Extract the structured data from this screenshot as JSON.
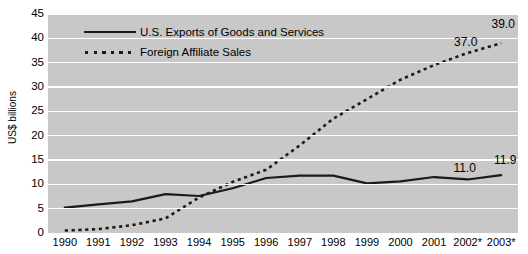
{
  "chart_data": {
    "type": "line",
    "title": "",
    "xlabel": "",
    "ylabel": "US$ billions",
    "ylim": [
      0,
      45
    ],
    "ytick_values": [
      0,
      5,
      10,
      15,
      20,
      25,
      30,
      35,
      40,
      45
    ],
    "ytick_labels": [
      "0",
      "5",
      "10",
      "15",
      "20",
      "25",
      "30",
      "35",
      "40",
      "45"
    ],
    "grid": true,
    "grid_color": "#ffffff",
    "plot_background": "#c8c8c8",
    "legend_position": "top-left inside plot",
    "categories": [
      "1990",
      "1991",
      "1992",
      "1993",
      "1994",
      "1995",
      "1996",
      "1997",
      "1998",
      "1999",
      "2000",
      "2001",
      "2002*",
      "2003*"
    ],
    "x": [
      1990,
      1991,
      1992,
      1993,
      1994,
      1995,
      1996,
      1997,
      1998,
      1999,
      2000,
      2001,
      2002,
      2003
    ],
    "series": [
      {
        "name": "U.S. Exports of Goods and Services",
        "style": "solid",
        "color": "#1a1a1a",
        "values": [
          5.2,
          5.9,
          6.5,
          8.0,
          7.6,
          9.2,
          11.3,
          11.8,
          11.8,
          10.2,
          10.6,
          11.5,
          11.0,
          11.9
        ]
      },
      {
        "name": "Foreign Affiliate Sales",
        "style": "dotted",
        "color": "#1a1a1a",
        "values": [
          0.5,
          0.8,
          1.6,
          3.0,
          7.3,
          10.5,
          13.0,
          18.0,
          23.5,
          27.5,
          31.5,
          34.5,
          37.0,
          39.0
        ]
      }
    ],
    "annotations": [
      {
        "text": "37.0",
        "x": "2002*",
        "value": 37.0,
        "series": "Foreign Affiliate Sales"
      },
      {
        "text": "39.0",
        "x": "2003*",
        "value": 39.0,
        "series": "Foreign Affiliate Sales"
      },
      {
        "text": "11.0",
        "x": "2002*",
        "value": 11.0,
        "series": "U.S. Exports of Goods and Services"
      },
      {
        "text": "11.9",
        "x": "2003*",
        "value": 11.9,
        "series": "U.S. Exports of Goods and Services"
      }
    ]
  },
  "legend": {
    "items": [
      {
        "label": "U.S. Exports of Goods and Services",
        "style": "solid"
      },
      {
        "label": "Foreign Affiliate Sales",
        "style": "dotted"
      }
    ]
  }
}
